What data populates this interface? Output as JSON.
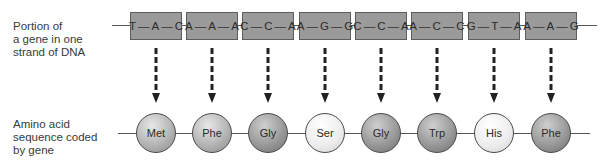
{
  "labels": {
    "dna": [
      "Portion of",
      "a gene in one",
      "strand of DNA"
    ],
    "amino": [
      "Amino acid",
      "sequence coded",
      "by gene"
    ]
  },
  "codons": [
    {
      "bases": [
        "T",
        "A",
        "C"
      ],
      "center_x": 156
    },
    {
      "bases": [
        "A",
        "A",
        "A"
      ],
      "center_x": 212
    },
    {
      "bases": [
        "C",
        "C",
        "A"
      ],
      "center_x": 268
    },
    {
      "bases": [
        "A",
        "G",
        "G"
      ],
      "center_x": 325
    },
    {
      "bases": [
        "C",
        "C",
        "A"
      ],
      "center_x": 381
    },
    {
      "bases": [
        "A",
        "C",
        "C"
      ],
      "center_x": 437
    },
    {
      "bases": [
        "G",
        "T",
        "A"
      ],
      "center_x": 494
    },
    {
      "bases": [
        "A",
        "A",
        "G"
      ],
      "center_x": 551
    }
  ],
  "amino_acids": [
    {
      "name": "Met",
      "shade": "mid"
    },
    {
      "name": "Phe",
      "shade": "mid"
    },
    {
      "name": "Gly",
      "shade": "dark"
    },
    {
      "name": "Ser",
      "shade": "light"
    },
    {
      "name": "Gly",
      "shade": "dark"
    },
    {
      "name": "Trp",
      "shade": "dark"
    },
    {
      "name": "His",
      "shade": "light"
    },
    {
      "name": "Phe",
      "shade": "dark"
    }
  ],
  "colors": {
    "codon_box": "#9a9a9a",
    "codon_border": "#5e5e5e",
    "arrow": "#222222",
    "line": "#555555"
  }
}
